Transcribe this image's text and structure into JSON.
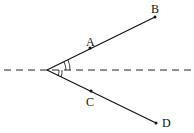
{
  "diagram": {
    "type": "geometry-angle-bisector",
    "points": {
      "vertex": {
        "x": 47,
        "y": 70
      },
      "A": {
        "label": "A",
        "x": 90,
        "y": 48
      },
      "B": {
        "label": "B",
        "x": 155,
        "y": 17
      },
      "C": {
        "label": "C",
        "x": 91,
        "y": 91
      },
      "D": {
        "label": "D",
        "x": 156,
        "y": 123
      }
    },
    "axis_line": {
      "style": "dashed",
      "y": 70,
      "x_start": 4,
      "x_end": 193
    },
    "angle_marks": {
      "upper": "double-arc",
      "lower": "double-arc"
    },
    "colors": {
      "stroke": "#111111",
      "background": "#ffffff"
    }
  }
}
